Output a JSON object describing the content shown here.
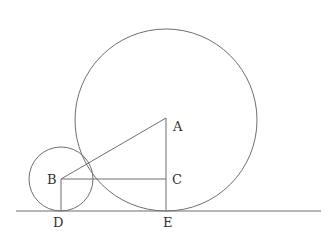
{
  "diagram": {
    "colors": {
      "stroke": "#6e6e6e",
      "label": "#333333",
      "background": "#ffffff"
    },
    "ground_line": {
      "x1": 16,
      "y1": 211,
      "x2": 321,
      "y2": 211
    },
    "circles": [
      {
        "name": "large-circle",
        "center": "A",
        "cx": 166,
        "cy": 120,
        "r": 91
      },
      {
        "name": "small-circle",
        "center": "B",
        "cx": 61,
        "cy": 179,
        "r": 32
      }
    ],
    "segments": [
      {
        "name": "segment-AB",
        "from": "A",
        "to": "B"
      },
      {
        "name": "segment-BC",
        "from": "B",
        "to": "C"
      },
      {
        "name": "segment-AE",
        "from": "A",
        "to": "E"
      },
      {
        "name": "segment-BD",
        "from": "B",
        "to": "D"
      }
    ],
    "points": {
      "A": {
        "x": 166,
        "y": 118
      },
      "B": {
        "x": 61,
        "y": 179
      },
      "C": {
        "x": 166,
        "y": 179
      },
      "D": {
        "x": 61,
        "y": 211
      },
      "E": {
        "x": 166,
        "y": 211
      }
    },
    "labels": {
      "A": {
        "text": "A",
        "x": 173,
        "y": 131
      },
      "B": {
        "text": "B",
        "x": 47,
        "y": 184
      },
      "C": {
        "text": "C",
        "x": 172,
        "y": 184
      },
      "D": {
        "text": "D",
        "x": 53,
        "y": 227
      },
      "E": {
        "text": "E",
        "x": 163,
        "y": 227
      }
    }
  }
}
